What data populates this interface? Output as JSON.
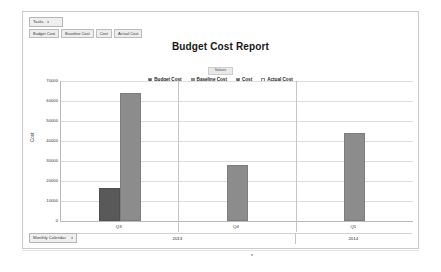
{
  "panel": {
    "tasks_dropdown": {
      "label": "Tasks",
      "caret": "▾"
    },
    "filters": [
      {
        "label": "Budget Cost"
      },
      {
        "label": "Baseline Cost"
      },
      {
        "label": "Cost"
      },
      {
        "label": "Actual Cost"
      }
    ],
    "calendar_dropdown": {
      "label": "Monthly Calendar",
      "caret": "▾"
    }
  },
  "legend": {
    "header": "Values",
    "entries": [
      {
        "label": "Budget Cost",
        "color": "#595959"
      },
      {
        "label": "Baseline Cost",
        "color": "#8c8c8c"
      },
      {
        "label": "Cost",
        "color": "#666666"
      },
      {
        "label": "Actual Cost",
        "color": "#f2f2f2"
      }
    ]
  },
  "chart_data": {
    "type": "bar",
    "title": "Budget Cost Report",
    "xlabel": "",
    "ylabel": "Cost",
    "ylim": [
      0,
      70000
    ],
    "ytick_labels": [
      "0",
      "10000",
      "20000",
      "30000",
      "40000",
      "50000",
      "60000",
      "70000"
    ],
    "ytick_values": [
      0,
      10000,
      20000,
      30000,
      40000,
      50000,
      60000,
      70000
    ],
    "grid": true,
    "legend_position": "top-center",
    "categories": [
      "Q3",
      "Q4",
      "Q1"
    ],
    "group_labels": [
      {
        "label": "2013",
        "span": 2
      },
      {
        "label": "2014",
        "span": 1
      }
    ],
    "series": [
      {
        "name": "Budget Cost",
        "color": "#595959",
        "values": [
          16500,
          0,
          0
        ]
      },
      {
        "name": "Baseline Cost",
        "color": "#8c8c8c",
        "values": [
          64000,
          28000,
          44000
        ]
      },
      {
        "name": "Cost",
        "color": "#666666",
        "values": [
          0,
          0,
          0
        ]
      },
      {
        "name": "Actual Cost",
        "color": "#f2f2f2",
        "values": [
          0,
          0,
          0
        ]
      }
    ]
  }
}
